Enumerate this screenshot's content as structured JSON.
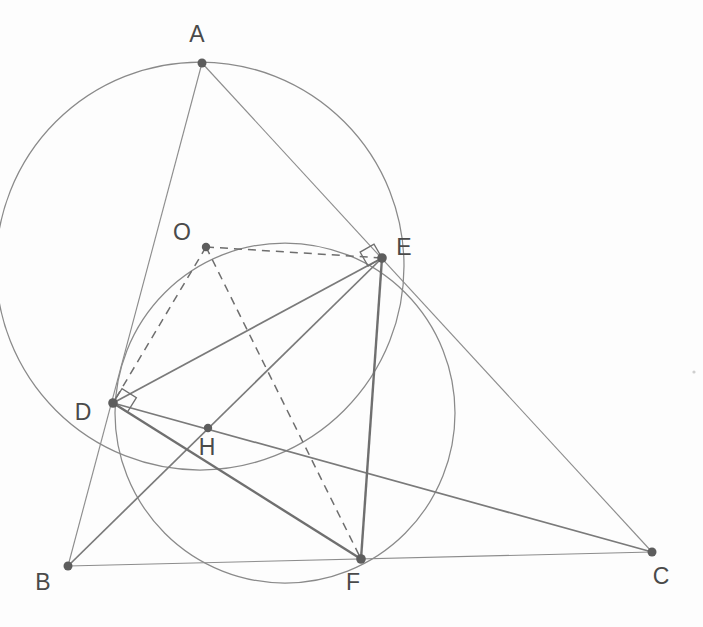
{
  "figure": {
    "canvas": {
      "width": 703,
      "height": 627
    },
    "colors": {
      "background": "#fdfdfd",
      "thin_line": "#8d8d8d",
      "bold_line": "#6f6f6f",
      "circle": "#8a8a8a",
      "dashed_line": "#6e6e6e",
      "vertex_dot": "#5d5d5d",
      "label_text": "#4a4a4a"
    }
  },
  "points": [
    {
      "id": "A",
      "label": "A",
      "x": 202,
      "y": 63,
      "label_x": 197,
      "label_y": 42,
      "dot_r": 4.5
    },
    {
      "id": "B",
      "label": "B",
      "x": 68,
      "y": 566,
      "label_x": 43,
      "label_y": 590,
      "dot_r": 4.5
    },
    {
      "id": "C",
      "label": "C",
      "x": 652,
      "y": 552,
      "label_x": 661,
      "label_y": 584,
      "dot_r": 4.5
    },
    {
      "id": "D",
      "label": "D",
      "x": 113,
      "y": 403,
      "label_x": 83,
      "label_y": 420,
      "dot_r": 4.8
    },
    {
      "id": "E",
      "label": "E",
      "x": 382,
      "y": 258,
      "label_x": 404,
      "label_y": 255,
      "dot_r": 4.8
    },
    {
      "id": "F",
      "label": "F",
      "x": 361,
      "y": 559,
      "label_x": 353,
      "label_y": 590,
      "dot_r": 4.8
    },
    {
      "id": "H",
      "label": "H",
      "x": 208,
      "y": 428,
      "label_x": 207,
      "label_y": 455,
      "dot_r": 4.2
    },
    {
      "id": "O",
      "label": "O",
      "x": 206,
      "y": 247,
      "label_x": 182,
      "label_y": 240,
      "dot_r": 4.2
    }
  ],
  "circles": [
    {
      "id": "circumcircle-ADE",
      "name": "circumcircle through A, D and E",
      "cx": 200,
      "cy": 266,
      "r": 204,
      "style": "thin"
    },
    {
      "id": "circle-O-DEF",
      "name": "circle O through D, E, F",
      "cx": 285,
      "cy": 413,
      "r": 170,
      "style": "thin"
    }
  ],
  "segments": [
    {
      "id": "AB",
      "from": "A",
      "to": "B",
      "weight": "thin",
      "dashed": false
    },
    {
      "id": "AC",
      "from": "A",
      "to": "C",
      "weight": "thin",
      "dashed": false
    },
    {
      "id": "BC",
      "from": "B",
      "to": "C",
      "weight": "thin",
      "dashed": false
    },
    {
      "id": "BE",
      "from": "B",
      "to": "E",
      "weight": "medium",
      "dashed": false
    },
    {
      "id": "DC",
      "from": "D",
      "to": "C",
      "weight": "medium",
      "dashed": false
    },
    {
      "id": "EF",
      "from": "E",
      "to": "F",
      "weight": "bold",
      "dashed": false
    },
    {
      "id": "DF",
      "from": "D",
      "to": "F",
      "weight": "bold",
      "dashed": false
    },
    {
      "id": "DE",
      "from": "D",
      "to": "E",
      "weight": "medium",
      "dashed": false
    },
    {
      "id": "OD",
      "from": "O",
      "to": "D",
      "weight": "dashed",
      "dashed": true
    },
    {
      "id": "OE",
      "from": "O",
      "to": "E",
      "weight": "dashed",
      "dashed": true
    },
    {
      "id": "OF",
      "from": "O",
      "to": "F",
      "weight": "dashed",
      "dashed": true
    }
  ],
  "right_angles": [
    {
      "id": "right-angle-at-D",
      "at": "D",
      "size": 17,
      "rotation": -58
    },
    {
      "id": "right-angle-at-E",
      "at": "E",
      "size": 16,
      "rotation": 150
    }
  ],
  "labels": {
    "A": "A",
    "B": "B",
    "C": "C",
    "D": "D",
    "E": "E",
    "F": "F",
    "H": "H",
    "O": "O"
  }
}
